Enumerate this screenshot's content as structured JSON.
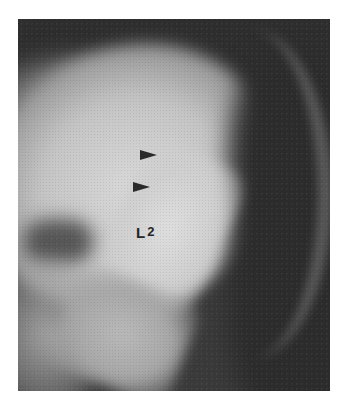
{
  "figure": {
    "type": "radiograph",
    "label": {
      "letter": "L",
      "number": "2"
    },
    "annotations": [
      {
        "name": "arrowhead-upper",
        "direction": "right",
        "x": 140,
        "y": 155
      },
      {
        "name": "arrowhead-lower",
        "direction": "right",
        "x": 133,
        "y": 187
      }
    ],
    "colors": {
      "background": "#ffffff",
      "film_dark": "#2e2e2e",
      "bone_bright": "#d9d9d9",
      "marker": "#2a2a2a"
    }
  }
}
